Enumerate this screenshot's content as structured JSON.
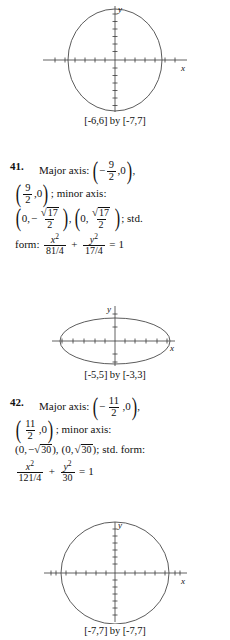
{
  "page": {
    "background": "#ffffff",
    "axis_color": "#3a3a3a",
    "curve_color": "#4a4a4a",
    "text_color": "#111111"
  },
  "graphs": [
    {
      "id": "graph-top",
      "caption": "[-6,6] by [-7,7]",
      "x_label": "x",
      "y_label": "y",
      "shape": "ellipse-vertical",
      "x_range": [
        -6,
        6
      ],
      "y_range": [
        -7,
        7
      ],
      "semi_axis_x": 4.5,
      "semi_axis_y": 6.2
    },
    {
      "id": "graph-mid",
      "caption": "[-5,5] by [-3,3]",
      "x_label": "x",
      "y_label": "y",
      "shape": "ellipse-horizontal",
      "x_range": [
        -5,
        5
      ],
      "y_range": [
        -3,
        3
      ],
      "semi_axis_x": 4.4,
      "semi_axis_y": 2.4
    },
    {
      "id": "graph-bottom",
      "caption": "[-7,7] by [-7,7]",
      "x_label": "x",
      "y_label": "y",
      "shape": "circle",
      "x_range": [
        -7,
        7
      ],
      "y_range": [
        -7,
        7
      ],
      "semi_axis_x": 5.5,
      "semi_axis_y": 5.5
    }
  ],
  "problems": [
    {
      "number": "41.",
      "major_axis_label": "Major axis:",
      "major_point_1": {
        "x_num": "9",
        "x_den": "2",
        "x_sign": "−",
        "y": "0"
      },
      "major_point_2": {
        "x_num": "9",
        "x_den": "2",
        "x_sign": "",
        "y": "0"
      },
      "minor_axis_label": "; minor axis:",
      "minor_point_1": {
        "x": "0,",
        "sign": "−",
        "radicand": "17",
        "den": "2"
      },
      "minor_point_2": {
        "x": "0,",
        "sign": "",
        "radicand": "17",
        "den": "2"
      },
      "std_tail": "; std.",
      "form_label": "form:",
      "form": {
        "x_den": "81/4",
        "y_den": "17/4",
        "rhs": "1"
      },
      "comma": ",",
      "sep": ","
    },
    {
      "number": "42.",
      "major_axis_label": "Major axis:",
      "major_point_1": {
        "x_num": "11",
        "x_den": "2",
        "x_sign": "−",
        "y": "0"
      },
      "major_point_2": {
        "x_num": "11",
        "x_den": "2",
        "x_sign": "",
        "y": "0"
      },
      "minor_axis_label": "; minor axis:",
      "minor_inline": {
        "p1_pre": "(0,",
        "p1_sign": "−",
        "p1_radicand": "30",
        "p1_post": "),",
        "p2_pre": "(0,",
        "p2_radicand": "30",
        "p2_post": ");",
        "tail": "std.  form:"
      },
      "form": {
        "x_den": "121/4",
        "y_den": "30",
        "rhs": "1"
      },
      "comma": ",",
      "sep": ","
    }
  ],
  "symbols": {
    "x_var": "x",
    "y_var": "y",
    "squared": "2",
    "plus": "+",
    "equals": "=",
    "radical": "√",
    "paren_open": "(",
    "paren_close": ")"
  }
}
